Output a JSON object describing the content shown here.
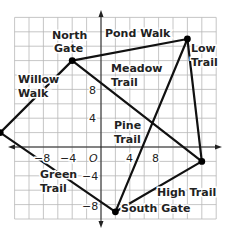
{
  "grid": {
    "x_min": -12,
    "x_max": 16,
    "y_min": -10,
    "y_max": 18,
    "units_per_cell": 2,
    "origin_px": [
      101,
      147
    ],
    "px_per_unit": 7.2
  },
  "axes": {
    "origin_label": "O",
    "x_ticks": [
      {
        "value": -8,
        "label": "−8"
      },
      {
        "value": -4,
        "label": "−4"
      },
      {
        "value": 4,
        "label": "4"
      },
      {
        "value": 8,
        "label": "8"
      }
    ],
    "y_ticks": [
      {
        "value": 8,
        "label": "8"
      },
      {
        "value": 4,
        "label": "4"
      },
      {
        "value": -4,
        "label": "−4"
      },
      {
        "value": -8,
        "label": "−8"
      }
    ]
  },
  "points": {
    "north_gate": {
      "label": "North Gate",
      "x": -4,
      "y": 12
    },
    "low_corner": {
      "x": 12,
      "y": 15
    },
    "willow_corner": {
      "x": -14,
      "y": 2
    },
    "east_corner": {
      "x": 14,
      "y": -2
    },
    "south_gate": {
      "label": "South Gate",
      "x": 2,
      "y": -9
    }
  },
  "trails": [
    {
      "name": "Pond Walk",
      "from": "north_gate",
      "to": "low_corner"
    },
    {
      "name": "Low Trail",
      "from": "low_corner",
      "to": "east_corner"
    },
    {
      "name": "Meadow Trail",
      "from": "north_gate",
      "to": "east_corner"
    },
    {
      "name": "Willow Walk",
      "from": "north_gate",
      "to": "willow_corner"
    },
    {
      "name": "Green Trail",
      "from": "willow_corner",
      "to": "south_gate"
    },
    {
      "name": "High Trail",
      "from": "south_gate",
      "to": "east_corner"
    },
    {
      "name": "Pine Trail",
      "from": "south_gate",
      "to": "low_corner"
    }
  ],
  "labels": {
    "north_gate_line1": "North",
    "north_gate_line2": "Gate",
    "pond_walk": "Pond Walk",
    "low_trail_line1": "Low",
    "low_trail_line2": "Trail",
    "meadow_trail_line1": "Meadow",
    "meadow_trail_line2": "Trail",
    "willow_walk_line1": "Willow",
    "willow_walk_line2": "Walk",
    "pine_trail_line1": "Pine",
    "pine_trail_line2": "Trail",
    "green_trail_line1": "Green",
    "green_trail_line2": "Trail",
    "high_trail": "High Trail",
    "south_gate": "South Gate"
  }
}
